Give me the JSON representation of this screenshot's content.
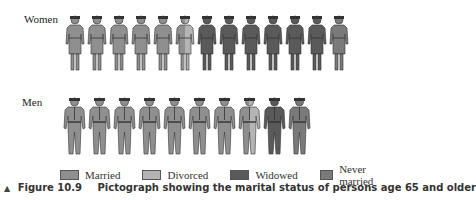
{
  "chart_data": {
    "type": "pictograph",
    "title": "Pictograph showing the marital status of persons age 65 and older",
    "figure_number": "Figure 10.9",
    "categories": [
      "Married",
      "Divorced",
      "Widowed",
      "Never married"
    ],
    "colors": {
      "Married": "#8f8f8f",
      "Divorced": "#b4b4b4",
      "Widowed": "#5a5a5a",
      "Never married": "#7a7a7a"
    },
    "series": [
      {
        "name": "Women",
        "icon_count": 13,
        "icons": [
          "Married",
          "Married",
          "Married",
          "Married",
          "Married",
          "Married/Divorced",
          "Widowed",
          "Widowed",
          "Widowed",
          "Widowed",
          "Widowed",
          "Widowed",
          "Never married"
        ],
        "values": [
          5.5,
          0.5,
          6,
          1
        ]
      },
      {
        "name": "Men",
        "icon_count": 10,
        "icons": [
          "Married",
          "Married",
          "Married",
          "Married",
          "Married",
          "Married",
          "Married",
          "Married/Divorced",
          "Widowed",
          "Never married"
        ],
        "values": [
          7.5,
          0.5,
          1,
          1
        ]
      }
    ],
    "legend_position": "bottom",
    "grid": false
  },
  "labels": {
    "women": "Women",
    "men": "Men"
  },
  "legend": [
    {
      "label": "Married",
      "color": "#8f8f8f"
    },
    {
      "label": "Divorced",
      "color": "#b4b4b4"
    },
    {
      "label": "Widowed",
      "color": "#5a5a5a"
    },
    {
      "label": "Never married",
      "color": "#7a7a7a"
    }
  ],
  "caption": {
    "marker": "▲",
    "figure": "Figure 10.9",
    "text": "Pictograph showing the marital status of persons age 65 and older"
  }
}
